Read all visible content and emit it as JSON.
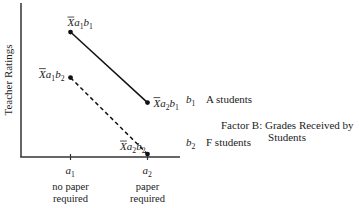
{
  "chart_data": {
    "type": "line",
    "title": "",
    "ylabel": "Teacher Ratings",
    "xlabel": "",
    "categories": [
      {
        "symbol": "a",
        "sub": "1",
        "desc_line1": "no paper",
        "desc_line2": "required"
      },
      {
        "symbol": "a",
        "sub": "2",
        "desc_line1": "paper",
        "desc_line2": "required"
      }
    ],
    "series": [
      {
        "name": "b1",
        "symbol": "b",
        "sub": "1",
        "legend_text": "A students",
        "style": "solid",
        "values": [
          0.85,
          0.37
        ],
        "point_labels": [
          {
            "bar": "X",
            "a_sub": "1",
            "b_sub": "1"
          },
          {
            "bar": "X",
            "a_sub": "2",
            "b_sub": "1"
          }
        ]
      },
      {
        "name": "b2",
        "symbol": "b",
        "sub": "2",
        "legend_text": "F students",
        "style": "dashed",
        "values": [
          0.54,
          0.02
        ],
        "point_labels": [
          {
            "bar": "X",
            "a_sub": "1",
            "b_sub": "2"
          },
          {
            "bar": "X",
            "a_sub": "2",
            "b_sub": "2"
          }
        ]
      }
    ],
    "factor_label_line1": "Factor B:  Grades Received by",
    "factor_label_line2": "Students",
    "ylim": [
      0,
      1
    ],
    "grid": false,
    "legend": "right"
  }
}
